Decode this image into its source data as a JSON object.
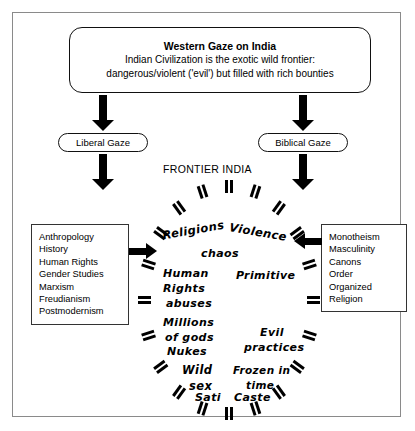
{
  "header": {
    "title": "Western Gaze on India",
    "line1": "Indian Civilization is the exotic wild frontier:",
    "line2": "dangerous/violent ('evil') but filled with rich bounties"
  },
  "gazes": {
    "left": "Liberal Gaze",
    "right": "Biblical Gaze"
  },
  "center_label": "FRONTIER INDIA",
  "left_list": [
    "Anthropology",
    "History",
    "Human Rights",
    "Gender Studies",
    "Marxism",
    "Freudianism",
    "Postmodernism"
  ],
  "right_list": [
    "Monotheism",
    "Masculinity",
    "Canons",
    "Order",
    "Organized",
    "Religion"
  ],
  "circle_words": [
    {
      "text": "Religions",
      "x": 21,
      "y": 40,
      "size": 11.5,
      "rot": -10
    },
    {
      "text": "Violence",
      "x": 88,
      "y": 42,
      "size": 11.5,
      "rot": 10
    },
    {
      "text": "chaos",
      "x": 60,
      "y": 64,
      "size": 11,
      "rot": 0
    },
    {
      "text": "Human",
      "x": 22,
      "y": 84,
      "size": 11,
      "rot": 0
    },
    {
      "text": "Rights",
      "x": 22,
      "y": 99,
      "size": 11,
      "rot": 0
    },
    {
      "text": "abuses",
      "x": 25,
      "y": 114,
      "size": 11,
      "rot": 0
    },
    {
      "text": "Primitive",
      "x": 95,
      "y": 86,
      "size": 11,
      "rot": 0
    },
    {
      "text": "Millions",
      "x": 22,
      "y": 133,
      "size": 11,
      "rot": 0
    },
    {
      "text": "of gods",
      "x": 24,
      "y": 148,
      "size": 11,
      "rot": 0
    },
    {
      "text": "Nukes",
      "x": 26,
      "y": 162,
      "size": 11,
      "rot": 0
    },
    {
      "text": "Evil",
      "x": 119,
      "y": 143,
      "size": 11,
      "rot": 0
    },
    {
      "text": "practices",
      "x": 103,
      "y": 158,
      "size": 11,
      "rot": 0
    },
    {
      "text": "Wild",
      "x": 41,
      "y": 180,
      "size": 11.5,
      "rot": 0
    },
    {
      "text": "sex",
      "x": 48,
      "y": 196,
      "size": 11.5,
      "rot": 0
    },
    {
      "text": "Frozen in",
      "x": 92,
      "y": 181,
      "size": 10.5,
      "rot": 0
    },
    {
      "text": "time",
      "x": 105,
      "y": 196,
      "size": 10.5,
      "rot": 0
    },
    {
      "text": "Sati",
      "x": 54,
      "y": 208,
      "size": 11,
      "rot": 0
    },
    {
      "text": "Caste",
      "x": 93,
      "y": 208,
      "size": 11,
      "rot": 0
    }
  ],
  "colors": {
    "ink": "#000000",
    "frame": "#8a8a8a",
    "background": "#ffffff"
  }
}
